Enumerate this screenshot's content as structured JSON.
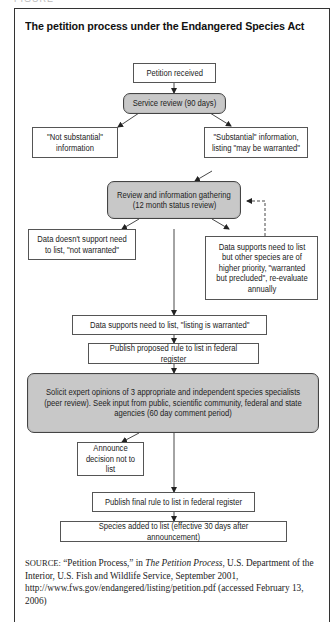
{
  "figure": {
    "label": "FIGURE",
    "title": "The petition process under the Endangered Species Act"
  },
  "nodes": {
    "petition_received": "Petition received",
    "service_review": "Service review (90 days)",
    "not_substantial": "\"Not substantial\" information",
    "substantial": "\"Substantial\" information, listing \"may be warranted\"",
    "review_gathering_line1": "Review and information gathering",
    "review_gathering_line2": "(12 month status review)",
    "not_warranted": "Data doesn't support need to list, \"not warranted\"",
    "warranted_precluded": "Data supports need to list but other species are of higher priority, \"warranted but precluded\", re-evaluate annually",
    "listing_warranted": "Data supports need to list, \"listing is warranted\"",
    "publish_proposed": "Publish proposed rule to list in federal register",
    "solicit_opinions": "Solicit expert opinions of 3 appropriate and independent species specialists (peer review). Seek input from public, scientific community, federal and state agencies (60 day comment period)",
    "announce_not_list": "Announce decision not to list",
    "publish_final": "Publish final rule to list in federal register",
    "species_added": "Species added to list (effective 30 days after announcement)"
  },
  "edges": [
    {
      "from": "petition_received",
      "to": "service_review",
      "style": "solid"
    },
    {
      "from": "service_review",
      "to": "not_substantial",
      "style": "solid"
    },
    {
      "from": "service_review",
      "to": "substantial",
      "style": "solid"
    },
    {
      "from": "substantial",
      "to": "review_gathering",
      "style": "solid"
    },
    {
      "from": "review_gathering",
      "to": "not_warranted",
      "style": "solid"
    },
    {
      "from": "review_gathering",
      "to": "warranted_precluded",
      "style": "solid"
    },
    {
      "from": "warranted_precluded",
      "to": "review_gathering",
      "style": "dashed"
    },
    {
      "from": "review_gathering",
      "to": "listing_warranted",
      "style": "solid"
    },
    {
      "from": "listing_warranted",
      "to": "publish_proposed",
      "style": "solid"
    },
    {
      "from": "publish_proposed",
      "to": "solicit_opinions",
      "style": "solid"
    },
    {
      "from": "solicit_opinions",
      "to": "announce_not_list",
      "style": "solid"
    },
    {
      "from": "solicit_opinions",
      "to": "publish_final",
      "style": "solid"
    },
    {
      "from": "publish_final",
      "to": "species_added",
      "style": "solid"
    }
  ],
  "source": {
    "label": "SOURCE:",
    "text_before_italic": " “Petition Process,” in ",
    "italic": "The Petition Process",
    "text_after_italic": ", U.S. Department of the Interior, U.S. Fish and Wildlife Service, September 2001, http://www.fws.gov/endangered/listing/petition.pdf (accessed February 13, 2006)"
  },
  "colors": {
    "gray_node": "#c8c8c8",
    "border": "#555555",
    "frame": "#333333"
  }
}
